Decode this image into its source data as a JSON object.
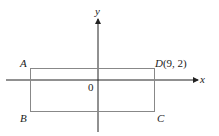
{
  "diagram": {
    "axes": {
      "x_label": "x",
      "y_label": "y",
      "origin_label": "0"
    },
    "vertices": [
      {
        "name": "A",
        "label": "A"
      },
      {
        "name": "B",
        "label": "B"
      },
      {
        "name": "C",
        "label": "C"
      },
      {
        "name": "D",
        "label": "D",
        "coords": "(9, 2)"
      }
    ],
    "colors": {
      "axis": "#222222",
      "rectangle": "#888888"
    }
  }
}
